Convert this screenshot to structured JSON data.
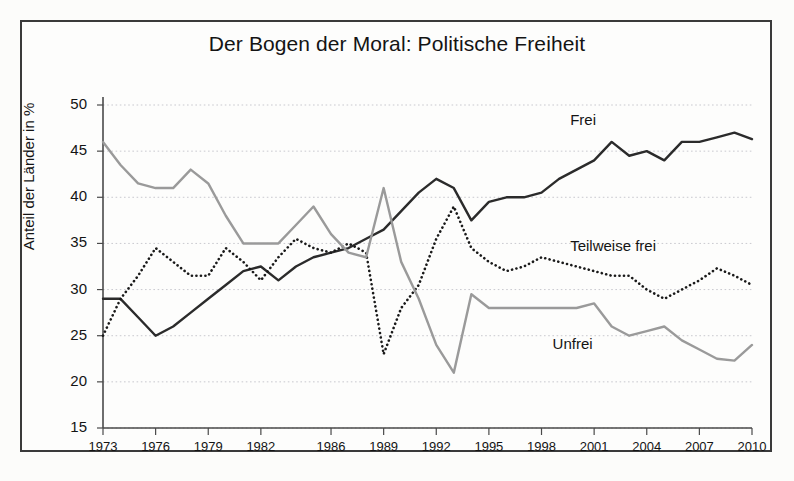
{
  "chart_data": {
    "type": "line",
    "title": "Der Bogen der Moral: Politische Freiheit",
    "xlabel": "",
    "ylabel": "Anteil der Länder in %",
    "ylim": [
      15,
      50
    ],
    "yticks": [
      15,
      20,
      25,
      30,
      35,
      40,
      45,
      50
    ],
    "xlim": [
      1973,
      2010
    ],
    "xticks": [
      1973,
      1976,
      1979,
      1982,
      1986,
      1989,
      1992,
      1995,
      1998,
      2001,
      2004,
      2007,
      2010
    ],
    "grid": true,
    "legend_position": "inline-annotations",
    "x": [
      1973,
      1974,
      1975,
      1976,
      1977,
      1978,
      1979,
      1980,
      1981,
      1982,
      1983,
      1984,
      1985,
      1986,
      1987,
      1988,
      1989,
      1990,
      1991,
      1992,
      1993,
      1994,
      1995,
      1996,
      1997,
      1998,
      1999,
      2000,
      2001,
      2002,
      2003,
      2004,
      2005,
      2006,
      2007,
      2008,
      2009,
      2010
    ],
    "series": [
      {
        "name": "Frei",
        "style": "solid",
        "color": "#2b2b2b",
        "values": [
          29,
          29,
          27,
          25,
          26,
          27.5,
          29,
          30.5,
          32,
          32.5,
          31,
          32.5,
          33.5,
          34,
          34.5,
          35.5,
          36.5,
          38.5,
          40.5,
          42,
          41,
          37.5,
          39.5,
          40,
          40,
          40.5,
          42,
          43,
          44,
          46,
          44.5,
          45,
          44,
          46,
          46,
          46.5,
          47,
          46.3
        ]
      },
      {
        "name": "Teilweise frei",
        "style": "dotted",
        "color": "#1a1a1a",
        "values": [
          25,
          29,
          31.5,
          34.5,
          33,
          31.5,
          31.5,
          34.5,
          33,
          31,
          33.5,
          35.5,
          34.5,
          34,
          35,
          34,
          23,
          28,
          30.5,
          35.5,
          39,
          34.5,
          33,
          32,
          32.5,
          33.5,
          33,
          32.5,
          32,
          31.5,
          31.5,
          30,
          29,
          30,
          31,
          32.3,
          31.5,
          30.5
        ]
      },
      {
        "name": "Unfrei",
        "style": "solid",
        "color": "#9a9a9a",
        "values": [
          46,
          43.5,
          41.5,
          41,
          41,
          43,
          41.5,
          38,
          35,
          35,
          35,
          37,
          39,
          36,
          34,
          33.5,
          41,
          33,
          29,
          24,
          21,
          29.5,
          28,
          28,
          28,
          28,
          28,
          28,
          28.5,
          26,
          25,
          25.5,
          26,
          24.5,
          23.5,
          22.5,
          22.3,
          24
        ]
      }
    ],
    "annotations": [
      {
        "text": "Frei",
        "x": 2001,
        "y": 48.3
      },
      {
        "text": "Teilweise frei",
        "x": 2001,
        "y": 34.6
      },
      {
        "text": "Unfrei",
        "x": 2000,
        "y": 24.0
      }
    ]
  }
}
